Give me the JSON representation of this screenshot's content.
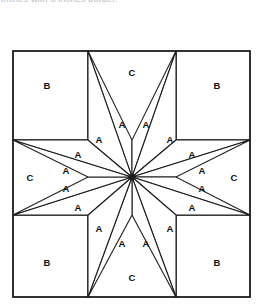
{
  "caption": {
    "text": "inches with 8 inches border.",
    "visible_fragment": true
  },
  "diagram": {
    "name": "eight-pointed-star-quilt-block",
    "colors": {
      "line": "#1c1c1c",
      "fill": "#ffffff",
      "label": "#111111",
      "caption": "#b9b9bd"
    },
    "frame": {
      "x": 13,
      "y": 51,
      "width": 237,
      "height": 246
    },
    "center": {
      "x": 132,
      "y": 177
    },
    "grid": {
      "vertical_lines": [
        88,
        176
      ],
      "horizontal_lines": [
        140,
        215
      ]
    },
    "piece_types": [
      {
        "key": "A",
        "label": "A",
        "count": 16,
        "shape": "diamond",
        "role": "star-point"
      },
      {
        "key": "B",
        "label": "B",
        "count": 4,
        "shape": "square",
        "role": "corner"
      },
      {
        "key": "C",
        "label": "C",
        "count": 4,
        "shape": "triangle",
        "role": "edge"
      }
    ],
    "labels": [
      {
        "text": "C",
        "x": 132,
        "y": 72,
        "piece": "C",
        "position": "top"
      },
      {
        "text": "C",
        "x": 30,
        "y": 177,
        "piece": "C",
        "position": "left"
      },
      {
        "text": "C",
        "x": 234,
        "y": 177,
        "piece": "C",
        "position": "right"
      },
      {
        "text": "C",
        "x": 132,
        "y": 277,
        "piece": "C",
        "position": "bottom"
      },
      {
        "text": "B",
        "x": 47,
        "y": 85,
        "piece": "B",
        "position": "top-left"
      },
      {
        "text": "B",
        "x": 217,
        "y": 85,
        "piece": "B",
        "position": "top-right"
      },
      {
        "text": "B",
        "x": 47,
        "y": 262,
        "piece": "B",
        "position": "bottom-left"
      },
      {
        "text": "B",
        "x": 217,
        "y": 262,
        "piece": "B",
        "position": "bottom-right"
      },
      {
        "text": "A",
        "x": 122,
        "y": 124,
        "piece": "A",
        "index": 1
      },
      {
        "text": "A",
        "x": 146,
        "y": 124,
        "piece": "A",
        "index": 2
      },
      {
        "text": "A",
        "x": 99,
        "y": 139,
        "piece": "A",
        "index": 3
      },
      {
        "text": "A",
        "x": 170,
        "y": 139,
        "piece": "A",
        "index": 4
      },
      {
        "text": "A",
        "x": 78,
        "y": 154,
        "piece": "A",
        "index": 5
      },
      {
        "text": "A",
        "x": 192,
        "y": 154,
        "piece": "A",
        "index": 6
      },
      {
        "text": "A",
        "x": 66,
        "y": 170,
        "piece": "A",
        "index": 7
      },
      {
        "text": "A",
        "x": 202,
        "y": 170,
        "piece": "A",
        "index": 8
      },
      {
        "text": "A",
        "x": 66,
        "y": 188,
        "piece": "A",
        "index": 9
      },
      {
        "text": "A",
        "x": 202,
        "y": 188,
        "piece": "A",
        "index": 10
      },
      {
        "text": "A",
        "x": 78,
        "y": 207,
        "piece": "A",
        "index": 11
      },
      {
        "text": "A",
        "x": 192,
        "y": 207,
        "piece": "A",
        "index": 12
      },
      {
        "text": "A",
        "x": 99,
        "y": 228,
        "piece": "A",
        "index": 13
      },
      {
        "text": "A",
        "x": 170,
        "y": 228,
        "piece": "A",
        "index": 14
      },
      {
        "text": "A",
        "x": 122,
        "y": 243,
        "piece": "A",
        "index": 15
      },
      {
        "text": "A",
        "x": 146,
        "y": 243,
        "piece": "A",
        "index": 16
      }
    ]
  }
}
